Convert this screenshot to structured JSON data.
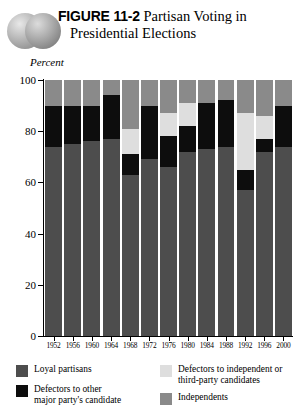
{
  "figure": {
    "number_label": "FIGURE 11-2",
    "title_line1": "Partisan Voting in",
    "title_line2": "Presidential Elections",
    "decoration": "two-overlapping-gray-circles"
  },
  "colors": {
    "loyal_partisans": "#4d4d4d",
    "defectors_other_party": "#0d0d0d",
    "defectors_independent": "#dedede",
    "independents": "#8a8a8a",
    "axis": "#000000",
    "background": "#ffffff"
  },
  "chart_data": {
    "type": "bar",
    "stacked": true,
    "title": "FIGURE 11-2 Partisan Voting in Presidential Elections",
    "xlabel": "",
    "ylabel": "Percent",
    "ylim": [
      0,
      100
    ],
    "yticks": [
      0,
      20,
      40,
      60,
      80,
      100
    ],
    "ytick_labels": [
      "0",
      "20",
      "40",
      "60",
      "80",
      "100"
    ],
    "grid": false,
    "legend_position": "bottom",
    "categories": [
      "1952",
      "1956",
      "1960",
      "1964",
      "1968",
      "1972",
      "1976",
      "1980",
      "1984",
      "1988",
      "1992",
      "1996",
      "2000"
    ],
    "series": [
      {
        "name": "Loyal partisans",
        "color": "#4d4d4d",
        "values": [
          74,
          75,
          76,
          77,
          63,
          69,
          66,
          72,
          73,
          74,
          57,
          72,
          74
        ]
      },
      {
        "name": "Defectors to other major party's candidate",
        "color": "#0d0d0d",
        "values": [
          16,
          15,
          14,
          17,
          8,
          21,
          12,
          10,
          18,
          18,
          8,
          5,
          16
        ]
      },
      {
        "name": "Defectors to independent or third-party candidates",
        "color": "#dedede",
        "values": [
          0,
          0,
          0,
          0,
          10,
          0,
          9,
          9,
          0,
          0,
          22,
          9,
          0
        ]
      },
      {
        "name": "Independents",
        "color": "#8a8a8a",
        "values": [
          10,
          10,
          10,
          6,
          19,
          10,
          13,
          9,
          9,
          8,
          13,
          14,
          10
        ]
      }
    ]
  },
  "legend": {
    "items": [
      {
        "label": "Loyal partisans",
        "color": "#4d4d4d"
      },
      {
        "label": "Defectors to other\nmajor party's candidate",
        "color": "#0d0d0d"
      },
      {
        "label": "Defectors to independent or\nthird-party candidates",
        "color": "#dedede"
      },
      {
        "label": "Independents",
        "color": "#8a8a8a"
      }
    ],
    "item_0_label": "Loyal partisans",
    "item_1_label_line1": "Defectors to other",
    "item_1_label_line2": "major party's candidate",
    "item_2_label_line1": "Defectors to independent or",
    "item_2_label_line2": "third-party candidates",
    "item_3_label": "Independents"
  }
}
